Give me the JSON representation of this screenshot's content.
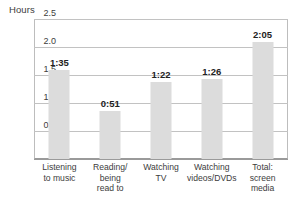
{
  "chart_data": {
    "type": "bar",
    "title": "",
    "ylabel": "Hours",
    "xlabel": "",
    "ylim": [
      0,
      2.5
    ],
    "yticks": [
      "0",
      "0.5",
      "1.0",
      "1.5",
      "2.0",
      "2.5"
    ],
    "ytick_values": [
      0,
      0.5,
      1.0,
      1.5,
      2.0,
      2.5
    ],
    "grid": true,
    "legend": "none",
    "categories": [
      "Listening to music",
      "Reading/being read to",
      "Watching TV",
      "Watching videos/DVDs",
      "Total: screen media"
    ],
    "category_lines": [
      [
        "Listening",
        "to music"
      ],
      [
        "Reading/",
        "being",
        "read to"
      ],
      [
        "Watching",
        "TV"
      ],
      [
        "Watching",
        "videos/DVDs"
      ],
      [
        "Total:",
        "screen",
        "media"
      ]
    ],
    "values": [
      1.583,
      0.85,
      1.367,
      1.433,
      2.083
    ],
    "data_labels": [
      "1:35",
      "0:51",
      "1:22",
      "1:26",
      "2:05"
    ],
    "bar_color": "#dcdcdc",
    "gridline_color": "#c2c2c2",
    "axis_color": "#9a9a9a",
    "text_color": "#3c3c3c",
    "label_color": "#222222"
  }
}
